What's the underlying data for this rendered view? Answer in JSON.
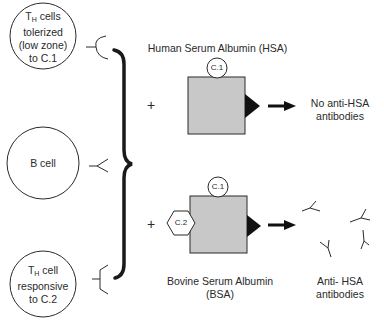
{
  "diagram": {
    "cells": [
      {
        "id": "th-tolerized",
        "prefix": "T",
        "subscript": "H",
        "line1_rest": " cells",
        "line2": "tolerized",
        "line3": "(low zone)",
        "line4": "to C.1"
      },
      {
        "id": "b-cell",
        "label": "B cell"
      },
      {
        "id": "th-responsive",
        "prefix": "T",
        "subscript": "H",
        "line1_rest": " cell",
        "line2": "responsive",
        "line3": "to C.2"
      }
    ],
    "top_row": {
      "antigen_label": "Human Serum Albumin (HSA)",
      "determinant": "C.1",
      "plus": "+",
      "result_line1": "No anti-HSA",
      "result_line2": "antibodies"
    },
    "bottom_row": {
      "determinant_top": "C.1",
      "determinant_side": "C.2",
      "plus": "+",
      "antigen_label_line1": "Bovine Serum Albumin",
      "antigen_label_line2": "(BSA)",
      "result_line1": "Anti- HSA",
      "result_line2": "antibodies"
    },
    "colors": {
      "carrier_fill": "#c8c8c8",
      "stroke": "#2a2a2a"
    }
  }
}
